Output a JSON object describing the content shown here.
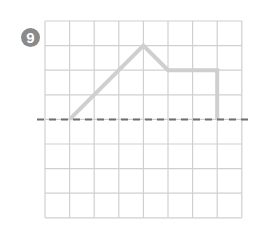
{
  "problem": {
    "number": "9"
  },
  "grid": {
    "cols": 8,
    "rows": 8,
    "x0": 45,
    "y0": 21,
    "cell": 24.6,
    "line_color": "#d0d0d0"
  },
  "axis_line": {
    "row": 4,
    "style": "dashed",
    "color": "#6f6f6f"
  },
  "shape_path": {
    "color": "#cfcfcf",
    "points_grid": [
      [
        1,
        4
      ],
      [
        4,
        1
      ],
      [
        5,
        2
      ],
      [
        7,
        2
      ],
      [
        7,
        4
      ]
    ]
  }
}
